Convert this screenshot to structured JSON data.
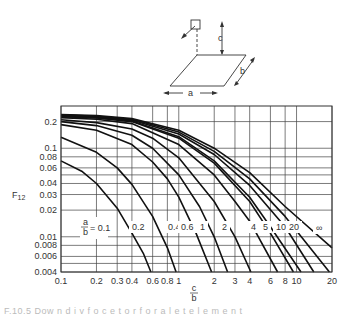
{
  "diagram": {
    "labels": {
      "a": "a",
      "b": "b",
      "c": "c"
    }
  },
  "chart_data": {
    "type": "line",
    "title": "",
    "xlabel": "c/b",
    "ylabel": "F12",
    "xscale": "log",
    "yscale": "log",
    "xlim": [
      0.1,
      20
    ],
    "ylim": [
      0.004,
      0.3
    ],
    "grid": true,
    "x_ticks": [
      0.1,
      0.2,
      0.3,
      0.4,
      0.6,
      0.8,
      1,
      2,
      3,
      4,
      6,
      8,
      10,
      20
    ],
    "x_tick_labels": [
      "0.1",
      "0.2",
      "0.3",
      "0.4",
      "0.6",
      "0.8",
      "1",
      "2",
      "3",
      "4",
      "6",
      "8",
      "10",
      "20"
    ],
    "y_ticks": [
      0.2,
      0.1,
      0.08,
      0.06,
      0.04,
      0.03,
      0.02,
      0.01,
      0.008,
      0.006,
      0.004
    ],
    "y_tick_labels": [
      "0.2",
      "0.1",
      "0.08",
      "0.06",
      "0.04",
      "0.03",
      "0.02",
      "0.01",
      "0.008",
      "0.006",
      "0.004"
    ],
    "y_minor_grid": [
      0.05,
      0.005
    ],
    "legend": "curves labeled by a/b",
    "series": [
      {
        "name": "a/b = 0.1",
        "label": "a/b = 0.1",
        "x": [
          0.1,
          0.15,
          0.2,
          0.3,
          0.4,
          0.5,
          0.58
        ],
        "values": [
          0.072,
          0.055,
          0.04,
          0.021,
          0.011,
          0.0065,
          0.004
        ]
      },
      {
        "name": "a/b = 0.2",
        "label": "0.2",
        "x": [
          0.1,
          0.2,
          0.3,
          0.4,
          0.6,
          0.8,
          0.95
        ],
        "values": [
          0.133,
          0.09,
          0.06,
          0.039,
          0.017,
          0.0075,
          0.004
        ]
      },
      {
        "name": "a/b = 0.4",
        "label": "0.4",
        "x": [
          0.1,
          0.2,
          0.4,
          0.6,
          0.8,
          1,
          1.4,
          1.9
        ],
        "values": [
          0.185,
          0.16,
          0.11,
          0.07,
          0.045,
          0.028,
          0.011,
          0.004
        ]
      },
      {
        "name": "a/b = 0.6",
        "label": "0.6",
        "x": [
          0.1,
          0.2,
          0.4,
          0.6,
          1,
          1.5,
          2,
          2.6
        ],
        "values": [
          0.2,
          0.18,
          0.14,
          0.1,
          0.05,
          0.022,
          0.01,
          0.004
        ]
      },
      {
        "name": "a/b = 1",
        "label": "1",
        "x": [
          0.1,
          0.2,
          0.4,
          0.6,
          1,
          2,
          3,
          4.1
        ],
        "values": [
          0.21,
          0.195,
          0.165,
          0.13,
          0.078,
          0.025,
          0.01,
          0.004
        ]
      },
      {
        "name": "a/b = 2",
        "label": "2",
        "x": [
          0.1,
          0.2,
          0.4,
          1,
          2,
          3,
          4,
          6.9
        ],
        "values": [
          0.222,
          0.212,
          0.19,
          0.11,
          0.05,
          0.025,
          0.015,
          0.004
        ]
      },
      {
        "name": "a/b = 4",
        "label": "4",
        "x": [
          0.1,
          0.2,
          0.4,
          1,
          2,
          4,
          6,
          9.4
        ],
        "values": [
          0.228,
          0.22,
          0.2,
          0.13,
          0.068,
          0.025,
          0.011,
          0.004
        ]
      },
      {
        "name": "a/b = 5",
        "label": "5",
        "x": [
          0.1,
          0.2,
          0.4,
          1,
          2,
          4,
          6,
          10.9
        ],
        "values": [
          0.23,
          0.222,
          0.203,
          0.135,
          0.072,
          0.028,
          0.013,
          0.004
        ]
      },
      {
        "name": "a/b = 10",
        "label": "10",
        "x": [
          0.1,
          0.2,
          0.4,
          1,
          2,
          4,
          8,
          14
        ],
        "values": [
          0.235,
          0.226,
          0.208,
          0.145,
          0.085,
          0.038,
          0.013,
          0.004
        ]
      },
      {
        "name": "a/b = 20",
        "label": "20",
        "x": [
          0.1,
          0.2,
          0.4,
          1,
          2,
          4,
          8,
          19
        ],
        "values": [
          0.238,
          0.23,
          0.212,
          0.152,
          0.092,
          0.045,
          0.017,
          0.004
        ]
      },
      {
        "name": "a/b = ∞",
        "label": "∞",
        "x": [
          0.1,
          0.2,
          0.4,
          1,
          2,
          4,
          8,
          20
        ],
        "values": [
          0.24,
          0.234,
          0.216,
          0.16,
          0.1,
          0.053,
          0.022,
          0.0075
        ]
      }
    ],
    "annotations": [
      "a/b = 0.1",
      "0.2",
      "0.4",
      "0.6",
      "1",
      "2",
      "4",
      "5",
      "10",
      "20",
      "∞"
    ]
  },
  "caption": {
    "text": "F.10.5   Dow n d i   v  f  o  c  e    t  o  r   f  o  r   a   l    e   t   e  l  e  m  e  n  t"
  }
}
